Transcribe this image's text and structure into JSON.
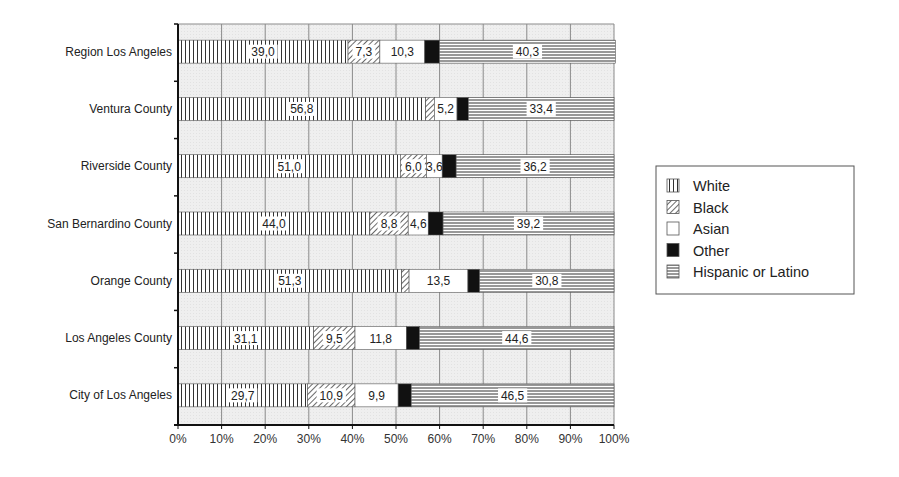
{
  "chart_data": {
    "type": "bar",
    "orientation": "horizontal",
    "stacked": true,
    "percent_stacked": true,
    "title": "",
    "xlabel": "",
    "ylabel": "",
    "xlim": [
      0,
      100
    ],
    "x_ticks": [
      "0%",
      "10%",
      "20%",
      "30%",
      "40%",
      "50%",
      "60%",
      "70%",
      "80%",
      "90%",
      "100%"
    ],
    "grid": true,
    "legend_position": "right",
    "categories": [
      "Region Los Angeles",
      "Ventura County",
      "Riverside County",
      "San Bernardino County",
      "Orange County",
      "Los Angeles County",
      "City of Los Angeles"
    ],
    "series": [
      {
        "name": "White",
        "pattern": "vertical-lines",
        "values": [
          39.0,
          56.8,
          51.0,
          44.0,
          51.3,
          31.1,
          29.7
        ],
        "labels": [
          "39,0",
          "56,8",
          "51,0",
          "44,0",
          "51,3",
          "31,1",
          "29,7"
        ]
      },
      {
        "name": "Black",
        "pattern": "diagonal-hatch",
        "values": [
          7.3,
          2.0,
          6.0,
          8.8,
          1.7,
          9.5,
          10.9
        ],
        "labels": [
          "7,3",
          "",
          "6,0",
          "8,8",
          "",
          "9,5",
          "10,9"
        ]
      },
      {
        "name": "Asian",
        "pattern": "white",
        "values": [
          10.3,
          5.2,
          3.6,
          4.6,
          13.5,
          11.8,
          9.9
        ],
        "labels": [
          "10,3",
          "5,2",
          "3,6",
          "4,6",
          "13,5",
          "11,8",
          "9,9"
        ]
      },
      {
        "name": "Other",
        "pattern": "solid-black",
        "values": [
          3.4,
          2.6,
          3.2,
          3.4,
          2.7,
          3.0,
          3.0
        ],
        "labels": [
          "",
          "",
          "",
          "",
          "",
          "",
          ""
        ]
      },
      {
        "name": "Hispanic or Latino",
        "pattern": "horizontal-lines",
        "values": [
          40.3,
          33.4,
          36.2,
          39.2,
          30.8,
          44.6,
          46.5
        ],
        "labels": [
          "40,3",
          "33,4",
          "36,2",
          "39,2",
          "30,8",
          "44,6",
          "46,5"
        ]
      }
    ]
  },
  "legend": {
    "items": [
      {
        "label": "White",
        "pattern": "vertical-lines"
      },
      {
        "label": "Black",
        "pattern": "diagonal-hatch"
      },
      {
        "label": "Asian",
        "pattern": "white"
      },
      {
        "label": "Other",
        "pattern": "solid-black"
      },
      {
        "label": "Hispanic or Latino",
        "pattern": "horizontal-lines"
      }
    ]
  },
  "colors": {
    "plot_background": "#eeeeee",
    "grid": "#8a8a8a",
    "axis": "#111111",
    "pattern_ink": "#333333",
    "other_fill": "#111111"
  }
}
